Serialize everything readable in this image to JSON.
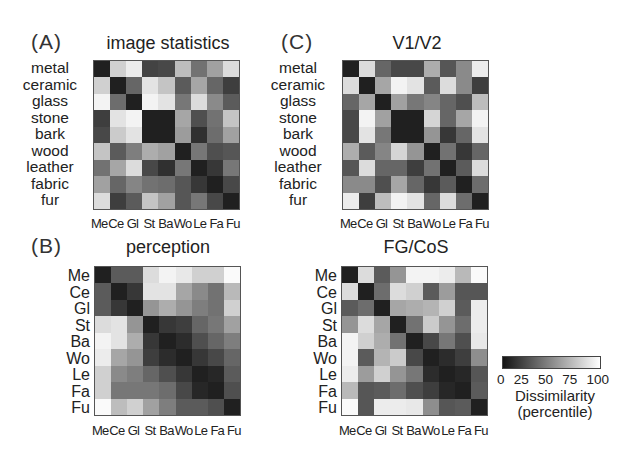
{
  "colorbar": {
    "ticks": [
      "0",
      "25",
      "50",
      "75",
      "100"
    ],
    "label_line1": "Dissimilarity",
    "label_line2": "(percentile)",
    "low_color": "#141414",
    "high_color": "#ffffff"
  },
  "panels": {
    "A": {
      "letter": "(A)",
      "title": "image statistics"
    },
    "B": {
      "letter": "(B)",
      "title": "perception"
    },
    "C": {
      "letter": "(C)",
      "title": "V1/V2"
    },
    "D": {
      "letter": "",
      "title": "FG/CoS"
    }
  },
  "labels": {
    "full": [
      "metal",
      "ceramic",
      "glass",
      "stone",
      "bark",
      "wood",
      "leather",
      "fabric",
      "fur"
    ],
    "abbr": [
      "Me",
      "Ce",
      "Gl",
      "St",
      "Ba",
      "Wo",
      "Le",
      "Fa",
      "Fu"
    ]
  },
  "chart_data": [
    {
      "type": "heatmap",
      "panel": "(A)",
      "title": "image statistics",
      "row_labels": [
        "metal",
        "ceramic",
        "glass",
        "stone",
        "bark",
        "wood",
        "leather",
        "fabric",
        "fur"
      ],
      "col_labels": [
        "Me",
        "Ce",
        "Gl",
        "St",
        "Ba",
        "Wo",
        "Le",
        "Fa",
        "Fu"
      ],
      "value_range": [
        0,
        100
      ],
      "values": [
        [
          5,
          80,
          92,
          20,
          22,
          72,
          40,
          60,
          85
        ],
        [
          80,
          5,
          35,
          88,
          75,
          30,
          62,
          35,
          18
        ],
        [
          95,
          38,
          5,
          95,
          88,
          42,
          85,
          50,
          30
        ],
        [
          18,
          88,
          95,
          5,
          5,
          62,
          25,
          40,
          75
        ],
        [
          22,
          78,
          88,
          5,
          5,
          58,
          12,
          38,
          60
        ],
        [
          75,
          30,
          45,
          65,
          60,
          5,
          42,
          25,
          28
        ],
        [
          40,
          62,
          85,
          22,
          12,
          42,
          5,
          15,
          42
        ],
        [
          60,
          35,
          48,
          40,
          38,
          28,
          15,
          5,
          22
        ],
        [
          85,
          18,
          30,
          75,
          60,
          28,
          42,
          22,
          5
        ]
      ]
    },
    {
      "type": "heatmap",
      "panel": "(B)",
      "title": "perception",
      "row_labels": [
        "Me",
        "Ce",
        "Gl",
        "St",
        "Ba",
        "Wo",
        "Le",
        "Fa",
        "Fu"
      ],
      "col_labels": [
        "Me",
        "Ce",
        "Gl",
        "St",
        "Ba",
        "Wo",
        "Le",
        "Fa",
        "Fu"
      ],
      "value_range": [
        0,
        100
      ],
      "values": [
        [
          5,
          30,
          30,
          85,
          95,
          90,
          80,
          80,
          98
        ],
        [
          30,
          5,
          15,
          88,
          88,
          62,
          50,
          40,
          70
        ],
        [
          30,
          15,
          5,
          55,
          65,
          55,
          45,
          40,
          80
        ],
        [
          85,
          88,
          55,
          5,
          15,
          18,
          35,
          42,
          60
        ],
        [
          95,
          88,
          65,
          15,
          5,
          10,
          25,
          35,
          45
        ],
        [
          92,
          62,
          55,
          18,
          10,
          5,
          15,
          22,
          35
        ],
        [
          80,
          50,
          45,
          35,
          25,
          15,
          5,
          8,
          30
        ],
        [
          80,
          42,
          42,
          42,
          38,
          22,
          8,
          5,
          25
        ],
        [
          98,
          72,
          80,
          60,
          45,
          30,
          30,
          25,
          5
        ]
      ]
    },
    {
      "type": "heatmap",
      "panel": "(C)",
      "title": "V1/V2",
      "row_labels": [
        "metal",
        "ceramic",
        "glass",
        "stone",
        "bark",
        "wood",
        "leather",
        "fabric",
        "fur"
      ],
      "col_labels": [
        "Me",
        "Ce",
        "Gl",
        "St",
        "Ba",
        "Wo",
        "Le",
        "Fa",
        "Fu"
      ],
      "value_range": [
        0,
        100
      ],
      "values": [
        [
          5,
          85,
          35,
          22,
          22,
          65,
          28,
          50,
          92
        ],
        [
          85,
          5,
          62,
          95,
          88,
          30,
          85,
          50,
          18
        ],
        [
          35,
          62,
          5,
          60,
          42,
          48,
          35,
          25,
          72
        ],
        [
          22,
          95,
          60,
          5,
          5,
          82,
          35,
          62,
          95
        ],
        [
          22,
          88,
          42,
          5,
          5,
          55,
          15,
          35,
          88
        ],
        [
          65,
          30,
          48,
          82,
          55,
          5,
          40,
          15,
          35
        ],
        [
          28,
          85,
          35,
          35,
          18,
          40,
          5,
          30,
          85
        ],
        [
          50,
          50,
          25,
          62,
          35,
          15,
          30,
          5,
          38
        ],
        [
          92,
          18,
          72,
          95,
          88,
          35,
          85,
          38,
          5
        ]
      ]
    },
    {
      "type": "heatmap",
      "panel": "",
      "title": "FG/CoS",
      "row_labels": [
        "Me",
        "Ce",
        "Gl",
        "St",
        "Ba",
        "Wo",
        "Le",
        "Fa",
        "Fu"
      ],
      "col_labels": [
        "Me",
        "Ce",
        "Gl",
        "St",
        "Ba",
        "Wo",
        "Le",
        "Fa",
        "Fu"
      ],
      "value_range": [
        0,
        100
      ],
      "values": [
        [
          5,
          85,
          30,
          55,
          95,
          95,
          92,
          70,
          98
        ],
        [
          85,
          5,
          38,
          85,
          80,
          30,
          58,
          28,
          28
        ],
        [
          30,
          38,
          5,
          62,
          65,
          68,
          80,
          30,
          92
        ],
        [
          55,
          85,
          62,
          5,
          40,
          78,
          55,
          38,
          92
        ],
        [
          95,
          80,
          65,
          40,
          5,
          22,
          42,
          25,
          90
        ],
        [
          95,
          30,
          68,
          78,
          22,
          5,
          10,
          18,
          52
        ],
        [
          92,
          58,
          80,
          55,
          42,
          10,
          5,
          8,
          28
        ],
        [
          70,
          28,
          30,
          38,
          25,
          18,
          8,
          5,
          30
        ],
        [
          98,
          28,
          92,
          92,
          90,
          52,
          28,
          30,
          5
        ]
      ]
    }
  ]
}
